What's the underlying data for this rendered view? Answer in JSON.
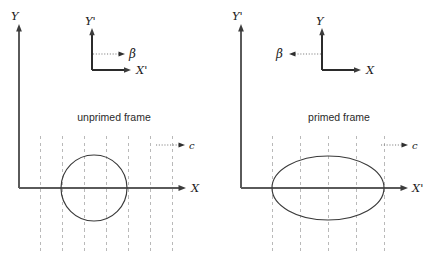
{
  "figure": {
    "background_color": "#ffffff",
    "width": 437,
    "height": 263
  },
  "panels": {
    "left": {
      "caption": "unprimed frame",
      "main_axes": {
        "vertical_label": "Y",
        "horizontal_label": "X"
      },
      "inset_axes": {
        "vertical_label": "Y'",
        "horizontal_label": "X'",
        "velocity_label": "β",
        "velocity_direction": "right"
      },
      "light_speed_label": "c",
      "light_speed_direction": "right",
      "shape": {
        "type": "circle",
        "description": "undeformed circular wavefront",
        "center_x": 94,
        "center_y": 188,
        "radius_x": 33,
        "radius_y": 33
      },
      "gridline_count": 7,
      "gridline_spacing": 22
    },
    "right": {
      "caption": "primed frame",
      "main_axes": {
        "vertical_label": "Y'",
        "horizontal_label": "X'"
      },
      "inset_axes": {
        "vertical_label": "Y",
        "horizontal_label": "X",
        "velocity_label": "β",
        "velocity_direction": "left"
      },
      "light_speed_label": "c",
      "light_speed_direction": "right",
      "shape": {
        "type": "ellipse",
        "description": "horizontally stretched elliptical wavefront",
        "center_x": 328,
        "center_y": 188,
        "radius_x": 56,
        "radius_y": 32
      },
      "gridline_count": 5,
      "gridline_spacing": 37
    }
  },
  "colors": {
    "axis": "#5a5a5a",
    "inset_axis": "#2b2b2b",
    "gridline": "#b9b9b9",
    "shape_outline": "#3a3a3a",
    "dotted_arrow": "#7d7d7d",
    "text": "#1a1a1a"
  }
}
